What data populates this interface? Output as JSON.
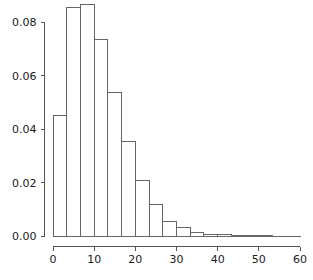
{
  "chart_data": {
    "type": "bar",
    "title": "",
    "subtitle": "",
    "xlabel": "",
    "ylabel": "",
    "grid": false,
    "legend": false,
    "legend_position": "none",
    "orientation": "vertical",
    "bar_style": "histogram-outline",
    "bin_width": 3.33,
    "xlim": [
      0,
      60
    ],
    "ylim": [
      0,
      0.088
    ],
    "xticks": [
      0,
      10,
      20,
      30,
      40,
      50,
      60
    ],
    "xtick_labels": [
      "0",
      "10",
      "20",
      "30",
      "40",
      "50",
      "60"
    ],
    "yticks": [
      0.0,
      0.02,
      0.04,
      0.06,
      0.08
    ],
    "ytick_labels": [
      "0.00",
      "0.02",
      "0.04",
      "0.06",
      "0.08"
    ],
    "bin_edges": [
      0,
      3.33,
      6.67,
      10,
      13.33,
      16.67,
      20,
      23.33,
      26.67,
      30,
      33.33,
      36.67,
      40,
      43.33,
      46.67,
      50,
      53.33,
      56.67,
      60
    ],
    "categories": [
      "0-3.3",
      "3.3-6.7",
      "6.7-10",
      "10-13.3",
      "13.3-16.7",
      "16.7-20",
      "20-23.3",
      "23.3-26.7",
      "26.7-30",
      "30-33.3",
      "33.3-36.7",
      "36.7-40",
      "40-43.3",
      "43.3-46.7",
      "46.7-50",
      "50-53.3",
      "53.3-56.7",
      "56.7-60"
    ],
    "values": [
      0.0449,
      0.0856,
      0.0865,
      0.0733,
      0.0535,
      0.0355,
      0.0209,
      0.0116,
      0.0056,
      0.003,
      0.0013,
      0.0007,
      0.0004,
      0.0002,
      0.0001,
      0.0001,
      0.0,
      0.0
    ]
  },
  "axis": {
    "y_tick_count": 5,
    "x_tick_count": 7
  },
  "colors": {
    "background": "#ffffff",
    "axis": "#555555",
    "bar_stroke": "#666666",
    "text": "#1a1a1a"
  }
}
